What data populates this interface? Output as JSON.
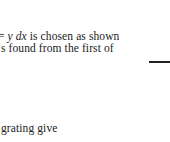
{
  "text": {
    "line1_prefix": "= ",
    "line1_math": "y dx",
    "line1_rest": " is chosen as shown",
    "line2": "s found from the first of",
    "line3": "grating give"
  },
  "decor": {
    "rule_color": "#222222"
  }
}
